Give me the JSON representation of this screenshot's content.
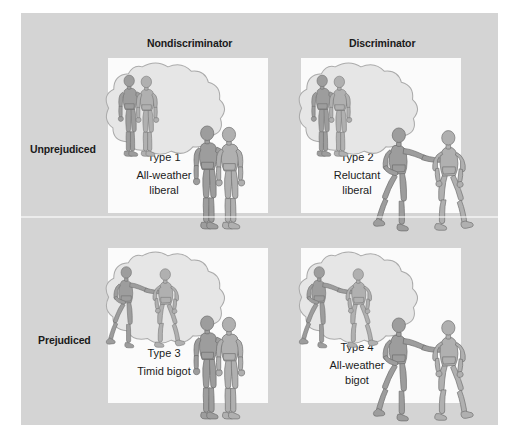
{
  "figure": {
    "title_present": false,
    "background_color": "#ffffff",
    "plate_color": "#d4d4d4",
    "panel_color": "#fbfbfb",
    "figure_fill": "#9a9a9a",
    "figure_fill_dark": "#828282",
    "figure_outline": "#6e6e6e",
    "bubble_fill": "#e4e4e4",
    "bubble_outline": "#a8a8a8"
  },
  "column_headers": [
    {
      "id": "nondiscriminator",
      "label": "Nondiscriminator"
    },
    {
      "id": "discriminator",
      "label": "Discriminator"
    }
  ],
  "row_headers": [
    {
      "id": "unprejudiced",
      "label": "Unprejudiced"
    },
    {
      "id": "prejudiced",
      "label": "Prejudiced"
    }
  ],
  "cells": [
    {
      "id": "type1",
      "type_label": "Type 1",
      "desc_line1": "All-weather",
      "desc_line2": "liberal",
      "row": "Unprejudiced",
      "column": "Nondiscriminator",
      "thought_scene": "two-figures-arm-around-shoulder",
      "action_scene": "two-figures-arm-around-shoulder"
    },
    {
      "id": "type2",
      "type_label": "Type 2",
      "desc_line1": "Reluctant",
      "desc_line2": "liberal",
      "row": "Unprejudiced",
      "column": "Discriminator",
      "thought_scene": "two-figures-arm-around-shoulder",
      "action_scene": "figure-pushing-other-away"
    },
    {
      "id": "type3",
      "type_label": "Type 3",
      "desc_line1": "Timid bigot",
      "desc_line2": "",
      "row": "Prejudiced",
      "column": "Nondiscriminator",
      "thought_scene": "figure-pushing-other-away",
      "action_scene": "two-figures-arm-around-shoulder"
    },
    {
      "id": "type4",
      "type_label": "Type 4",
      "desc_line1": "All-weather",
      "desc_line2": "bigot",
      "row": "Prejudiced",
      "column": "Discriminator",
      "thought_scene": "figure-pushing-other-away",
      "action_scene": "figure-pushing-other-away"
    }
  ]
}
